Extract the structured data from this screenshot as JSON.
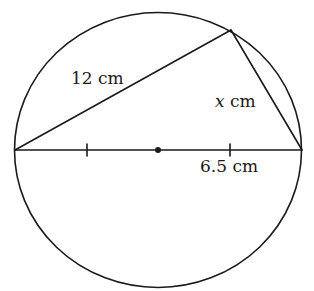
{
  "diagram": {
    "type": "circle-inscribed-triangle",
    "stroke_color": "#1a1a1a",
    "circle": {
      "center": [
        158,
        150
      ],
      "rx": 143.5,
      "ry": 137.5
    },
    "points": {
      "left": [
        15,
        150
      ],
      "right": [
        302,
        150
      ],
      "top": [
        231,
        30
      ],
      "center": [
        158,
        150
      ]
    },
    "ticks": [
      {
        "x": 87,
        "y": 150
      },
      {
        "x": 230,
        "y": 150
      }
    ],
    "labels": {
      "chord_left": {
        "number": "12",
        "unit": "cm",
        "x": 71,
        "y": 84
      },
      "chord_right": {
        "variable": "x",
        "unit": "cm",
        "x": 215,
        "y": 107
      },
      "radius": {
        "number": "6.5",
        "unit": "cm",
        "x": 200,
        "y": 172
      }
    }
  }
}
